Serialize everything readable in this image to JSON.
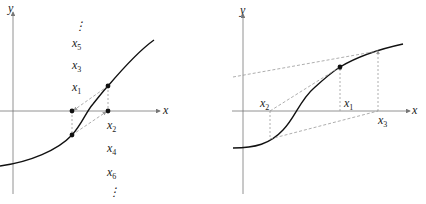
{
  "left_panel": {
    "axis_x_label": "x",
    "axis_y_label": "y",
    "labels": [
      {
        "base": "x",
        "sub": "5",
        "x": 72,
        "y": 47
      },
      {
        "base": "x",
        "sub": "3",
        "x": 72,
        "y": 69
      },
      {
        "base": "x",
        "sub": "1",
        "x": 72,
        "y": 91
      },
      {
        "base": "x",
        "sub": "2",
        "x": 107,
        "y": 129
      },
      {
        "base": "x",
        "sub": "4",
        "x": 107,
        "y": 152
      },
      {
        "base": "x",
        "sub": "6",
        "x": 107,
        "y": 176
      }
    ],
    "dots_top": "⋮",
    "dots_bottom": "⋮"
  },
  "right_panel": {
    "axis_x_label": "x",
    "axis_y_label": "y",
    "labels": [
      {
        "base": "x",
        "sub": "2",
        "x": 260,
        "y": 107
      },
      {
        "base": "x",
        "sub": "1",
        "x": 344,
        "y": 107
      },
      {
        "base": "x",
        "sub": "3",
        "x": 378,
        "y": 124
      }
    ]
  },
  "colors": {
    "curve": "#111111",
    "axis": "#777777",
    "dashed": "#999999"
  }
}
